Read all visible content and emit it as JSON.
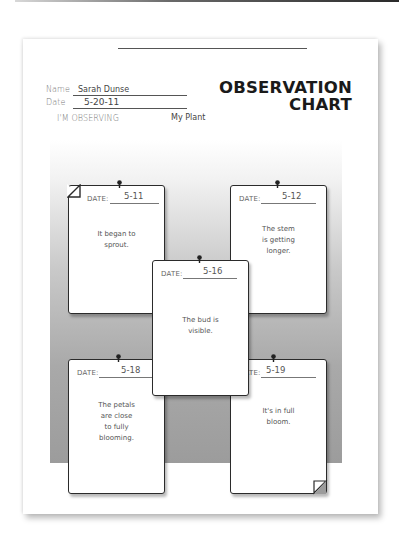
{
  "sheet": {
    "title_line1": "OBSERVATION",
    "title_line2": "CHART",
    "name_label": "Name",
    "name_value": "Sarah Dunse",
    "date_label": "Date",
    "date_value": "5-20-11",
    "observing_label": "I'M OBSERVING",
    "observing_value": "My Plant"
  },
  "cards": [
    {
      "date_label": "DATE:",
      "date": "5-11",
      "note": [
        "It began to",
        "sprout."
      ]
    },
    {
      "date_label": "DATE:",
      "date": "5-12",
      "note": [
        "The stem",
        "is getting",
        "longer."
      ]
    },
    {
      "date_label": "DATE:",
      "date": "5-16",
      "note": [
        "The bud is",
        "visible."
      ]
    },
    {
      "date_label": "DATE:",
      "date": "5-18",
      "note": [
        "The petals",
        "are close",
        "to fully",
        "blooming."
      ]
    },
    {
      "date_label": "DATE:",
      "date": "5-19",
      "note": [
        "It's in full",
        "bloom."
      ]
    }
  ],
  "colors": {
    "board_gray": "#a9a9a9",
    "ink": "#2b2b2b",
    "title": "#1a1a1a"
  }
}
